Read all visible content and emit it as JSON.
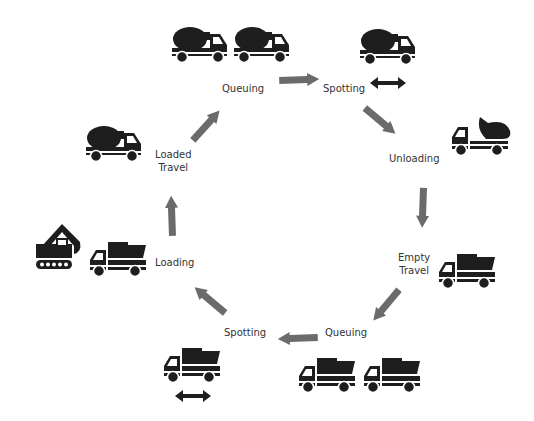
{
  "diagram": {
    "type": "cycle",
    "title": "",
    "colors": {
      "icon": "#1e1e1e",
      "arrow": "#6b6b6b",
      "text": "#333333",
      "background": "#ffffff"
    },
    "stages": [
      {
        "id": "queuing-loaded",
        "label_line1": "Queuing",
        "label_line2": "",
        "icon": "two-mixer-trucks-icon"
      },
      {
        "id": "spotting-loaded",
        "label_line1": "Spotting",
        "label_line2": "",
        "icon": "mixer-truck-with-double-arrow-icon"
      },
      {
        "id": "unloading",
        "label_line1": "Unloading",
        "label_line2": "",
        "icon": "truck-dumping-icon"
      },
      {
        "id": "empty-travel",
        "label_line1": "Empty",
        "label_line2": "Travel",
        "icon": "dump-truck-icon"
      },
      {
        "id": "queuing-empty",
        "label_line1": "Queuing",
        "label_line2": "",
        "icon": "two-dump-trucks-icon"
      },
      {
        "id": "spotting-empty",
        "label_line1": "Spotting",
        "label_line2": "",
        "icon": "dump-truck-with-double-arrow-icon"
      },
      {
        "id": "loading",
        "label_line1": "Loading",
        "label_line2": "",
        "icon": "excavator-and-dump-truck-icon"
      },
      {
        "id": "loaded-travel",
        "label_line1": "Loaded",
        "label_line2": "Travel",
        "icon": "mixer-truck-icon"
      }
    ],
    "flow": [
      "queuing-loaded",
      "spotting-loaded",
      "unloading",
      "empty-travel",
      "queuing-empty",
      "spotting-empty",
      "loading",
      "loaded-travel",
      "queuing-loaded"
    ],
    "direction": "clockwise"
  }
}
